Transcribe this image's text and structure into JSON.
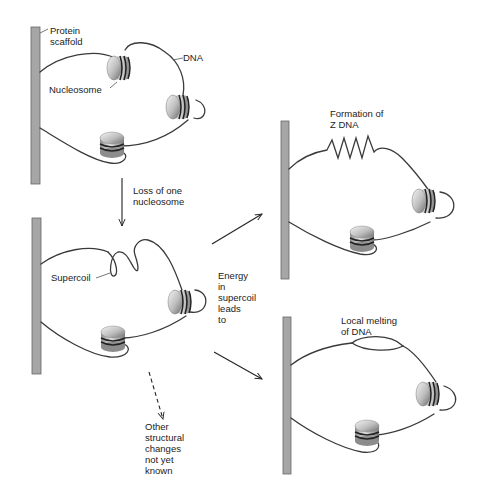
{
  "colors": {
    "background": "#ffffff",
    "scaffold": "#a6a6a6",
    "dna": "#3a3a3a",
    "nucleosome_light": "#f2f2f2",
    "nucleosome_dark": "#7a7a7a",
    "text": "#222222"
  },
  "panel_top_left": {
    "labels": {
      "protein_scaffold_line1": "Protein",
      "protein_scaffold_line2": "scaffold",
      "dna": "DNA",
      "nucleosome": "Nucleosome"
    },
    "nucleosome_count": 3
  },
  "transition_down": {
    "line1": "Loss of one",
    "line2": "nucleosome"
  },
  "panel_bottom_left": {
    "labels": {
      "supercoil": "Supercoil"
    },
    "nucleosome_count": 2
  },
  "energy_text": {
    "lines": [
      "Energy",
      "in",
      "supercoil",
      "leads",
      "to"
    ]
  },
  "panel_top_right": {
    "title_line1": "Formation of",
    "title_line2": "Z DNA",
    "nucleosome_count": 2
  },
  "panel_bottom_right": {
    "title_line1": "Local melting",
    "title_line2": "of DNA",
    "nucleosome_count": 2
  },
  "other_changes": {
    "lines": [
      "Other",
      "structural",
      "changes",
      "not yet",
      "known"
    ]
  }
}
